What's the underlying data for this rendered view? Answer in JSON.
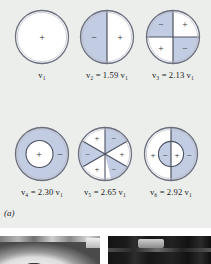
{
  "figure": {
    "caption": "(a)",
    "colors": {
      "background": "#eceeec",
      "shaded": "#c2cce2",
      "unshaded": "#ffffff",
      "outline": "#6b6f7d",
      "text": "#1a1a1a"
    },
    "modes": [
      {
        "id": "mode-1",
        "label": "v₁",
        "label_symbol": "v",
        "label_sub": "1",
        "label_value": "",
        "frequency_ratio": 1.0,
        "nodal_pattern": "none",
        "regions": [
          {
            "sign": "+",
            "shaded": false
          }
        ]
      },
      {
        "id": "mode-2",
        "label": "v₂ = 1.59 v₁",
        "label_symbol": "v",
        "label_sub": "2",
        "label_value": "1.59",
        "frequency_ratio": 1.59,
        "nodal_pattern": "one-diameter",
        "regions": [
          {
            "sign": "−",
            "shaded": true,
            "position": "left"
          },
          {
            "sign": "+",
            "shaded": false,
            "position": "right"
          }
        ]
      },
      {
        "id": "mode-3",
        "label": "v₃ = 2.13 v₁",
        "label_symbol": "v",
        "label_sub": "3",
        "label_value": "2.13",
        "frequency_ratio": 2.13,
        "nodal_pattern": "two-diameters",
        "regions": [
          {
            "sign": "−",
            "shaded": true,
            "position": "top-left"
          },
          {
            "sign": "+",
            "shaded": false,
            "position": "top-right"
          },
          {
            "sign": "+",
            "shaded": false,
            "position": "bottom-left"
          },
          {
            "sign": "−",
            "shaded": true,
            "position": "bottom-right"
          }
        ]
      },
      {
        "id": "mode-4",
        "label": "v₄ = 2.30 v₁",
        "label_symbol": "v",
        "label_sub": "4",
        "label_value": "2.30",
        "frequency_ratio": 2.3,
        "nodal_pattern": "one-circle",
        "regions": [
          {
            "sign": "+",
            "shaded": false,
            "position": "inner"
          },
          {
            "sign": "−",
            "shaded": true,
            "position": "outer-ring"
          }
        ]
      },
      {
        "id": "mode-5",
        "label": "v₅ = 2.65 v₁",
        "label_symbol": "v",
        "label_sub": "5",
        "label_value": "2.65",
        "frequency_ratio": 2.65,
        "nodal_pattern": "three-diameters",
        "regions": [
          {
            "sign": "+",
            "shaded": false,
            "position": "upper-left"
          },
          {
            "sign": "−",
            "shaded": true,
            "position": "upper-right"
          },
          {
            "sign": "+",
            "shaded": false,
            "position": "right"
          },
          {
            "sign": "−",
            "shaded": true,
            "position": "lower-right"
          },
          {
            "sign": "+",
            "shaded": false,
            "position": "lower-left"
          },
          {
            "sign": "−",
            "shaded": true,
            "position": "left"
          }
        ]
      },
      {
        "id": "mode-6",
        "label": "v₆ = 2.92 v₁",
        "label_symbol": "v",
        "label_sub": "6",
        "label_value": "2.92",
        "frequency_ratio": 2.92,
        "nodal_pattern": "one-diameter-one-circle",
        "regions": [
          {
            "sign": "+",
            "shaded": false,
            "position": "outer-left"
          },
          {
            "sign": "−",
            "shaded": true,
            "position": "inner-left"
          },
          {
            "sign": "+",
            "shaded": false,
            "position": "inner-right"
          },
          {
            "sign": "−",
            "shaded": true,
            "position": "outer-right"
          }
        ]
      }
    ]
  },
  "photos": [
    {
      "id": "photo-left",
      "description": "circular-membrane-photograph"
    },
    {
      "id": "photo-right",
      "description": "dark-vibration-photograph"
    }
  ]
}
